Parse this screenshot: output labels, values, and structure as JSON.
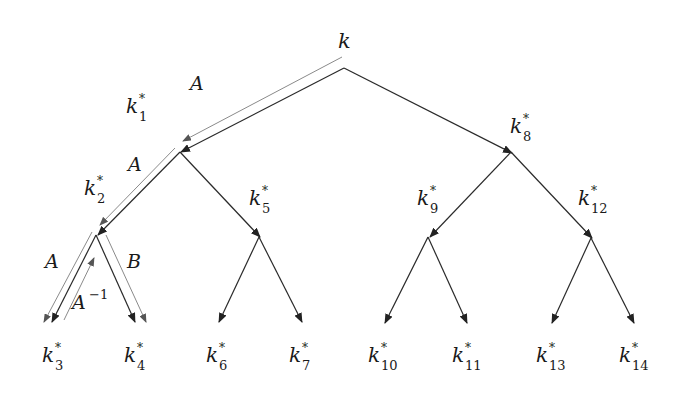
{
  "diagram": {
    "type": "binary-key-derivation-tree",
    "root": {
      "label": "k"
    },
    "nodes": [
      {
        "id": "k1",
        "base": "k",
        "sup": "*",
        "sub": "1"
      },
      {
        "id": "k2",
        "base": "k",
        "sup": "*",
        "sub": "2"
      },
      {
        "id": "k3",
        "base": "k",
        "sup": "*",
        "sub": "3"
      },
      {
        "id": "k4",
        "base": "k",
        "sup": "*",
        "sub": "4"
      },
      {
        "id": "k5",
        "base": "k",
        "sup": "*",
        "sub": "5"
      },
      {
        "id": "k6",
        "base": "k",
        "sup": "*",
        "sub": "6"
      },
      {
        "id": "k7",
        "base": "k",
        "sup": "*",
        "sub": "7"
      },
      {
        "id": "k8",
        "base": "k",
        "sup": "*",
        "sub": "8"
      },
      {
        "id": "k9",
        "base": "k",
        "sup": "*",
        "sub": "9"
      },
      {
        "id": "k10",
        "base": "k",
        "sup": "*",
        "sub": "10"
      },
      {
        "id": "k11",
        "base": "k",
        "sup": "*",
        "sub": "11"
      },
      {
        "id": "k12",
        "base": "k",
        "sup": "*",
        "sub": "12"
      },
      {
        "id": "k13",
        "base": "k",
        "sup": "*",
        "sub": "13"
      },
      {
        "id": "k14",
        "base": "k",
        "sup": "*",
        "sub": "14"
      }
    ],
    "edges": [
      [
        "k",
        "k1"
      ],
      [
        "k",
        "k8"
      ],
      [
        "k1",
        "k2"
      ],
      [
        "k1",
        "k5"
      ],
      [
        "k2",
        "k3"
      ],
      [
        "k2",
        "k4"
      ],
      [
        "k5",
        "k6"
      ],
      [
        "k5",
        "k7"
      ],
      [
        "k8",
        "k9"
      ],
      [
        "k8",
        "k12"
      ],
      [
        "k9",
        "k10"
      ],
      [
        "k9",
        "k11"
      ],
      [
        "k12",
        "k13"
      ],
      [
        "k12",
        "k14"
      ]
    ],
    "path_labels": {
      "a1": "A",
      "a2": "A",
      "a3": "A",
      "ainv_base": "A",
      "ainv_sup": "−1",
      "b": "B"
    }
  }
}
